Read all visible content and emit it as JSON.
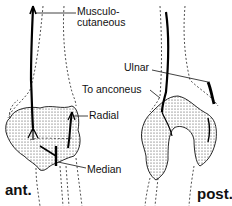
{
  "figure": {
    "labels": {
      "musculocutaneous_line1": "Musculo-",
      "musculocutaneous_line2": "cutaneous",
      "ulnar": "Ulnar",
      "to_anconeus": "To anconeus",
      "radial": "Radial",
      "median": "Median"
    },
    "views": {
      "anterior": "ant.",
      "posterior": "post."
    },
    "colors": {
      "ink": "#111111",
      "background": "#ffffff"
    }
  }
}
